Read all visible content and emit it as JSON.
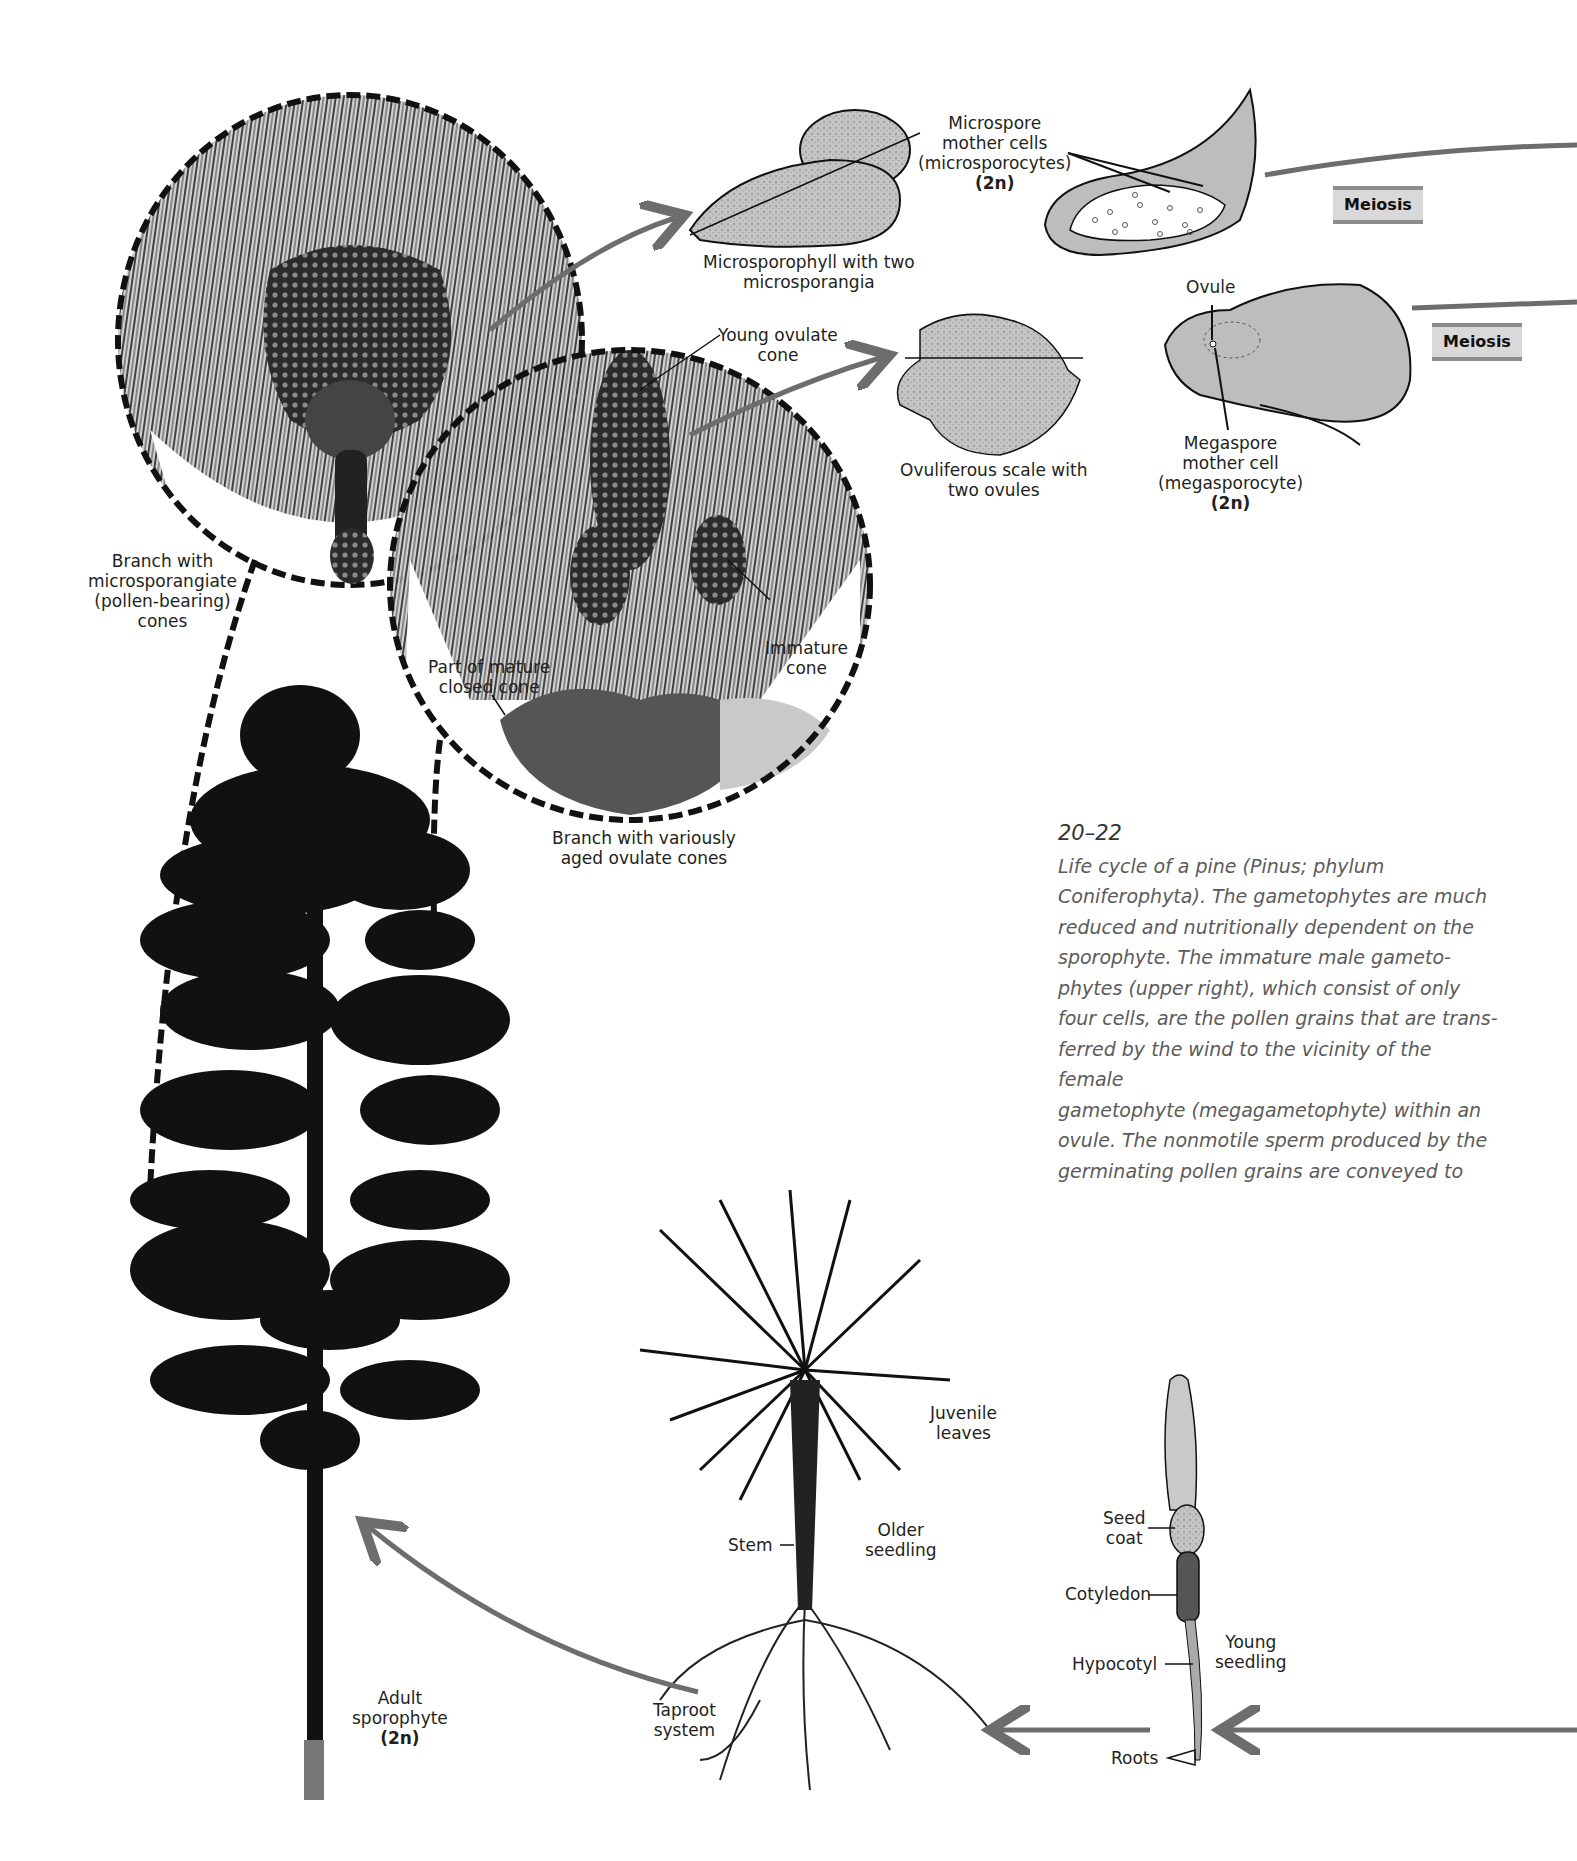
{
  "figure": {
    "number": "20–22",
    "caption_parts": [
      {
        "text": "Life cycle of a pine ",
        "style": "italic"
      },
      {
        "text": "(Pinus; ",
        "style": "upright"
      },
      {
        "text": "phylum ",
        "style": "italic"
      },
      {
        "text": "Coniferophyta).",
        "style": "upright"
      },
      {
        "text": " The gametophytes are much reduced and nutritionally dependent on the sporophyte. The immature male gameto-phytes (upper right), which consist of only four cells, are the pollen grains that are trans-ferred by the wind to the vicinity of the female gametophyte (megagametophyte) within an ovule. The nonmotile sperm produced by the germinating pollen grains are conveyed to",
        "style": "italic"
      }
    ],
    "caption_lines": [
      "Life cycle of a pine (Pinus; phylum",
      "Coniferophyta). The gametophytes are much",
      "reduced and nutritionally dependent on the",
      "sporophyte. The immature male gameto-",
      "phytes (upper right), which consist of only",
      "four cells, are the pollen grains that are trans-",
      "ferred by the wind to the vicinity of the female",
      "gametophyte (megagametophyte) within an",
      "ovule. The nonmotile sperm produced by the",
      "germinating pollen grains are conveyed to"
    ]
  },
  "labels": {
    "microspore_mother_cells": [
      "Microspore",
      "mother cells",
      "(microsporocytes)",
      "(2n)"
    ],
    "microsporophyll": [
      "Microsporophyll with two",
      "microsporangia"
    ],
    "young_ovulate_cone": [
      "Young ovulate",
      "cone"
    ],
    "ovuliferous_scale": [
      "Ovuliferous scale with",
      "two ovules"
    ],
    "ovule": "Ovule",
    "megaspore_mother_cell": [
      "Megaspore",
      "mother cell",
      "(megasporocyte)",
      "(2n)"
    ],
    "branch_microsporangiate": [
      "Branch with",
      "microsporangiate",
      "(pollen-bearing)",
      "cones"
    ],
    "immature_cone": [
      "Immature",
      "cone"
    ],
    "mature_closed_cone": [
      "Part of mature",
      "closed cone"
    ],
    "branch_ovulate": [
      "Branch with variously",
      "aged ovulate cones"
    ],
    "juvenile_leaves": [
      "Juvenile",
      "leaves"
    ],
    "stem": "Stem",
    "older_seedling": [
      "Older",
      "seedling"
    ],
    "taproot_system": [
      "Taproot",
      "system"
    ],
    "adult_sporophyte": [
      "Adult",
      "sporophyte",
      "(2n)"
    ],
    "seed_coat": [
      "Seed",
      "coat"
    ],
    "cotyledon": "Cotyledon",
    "hypocotyl": "Hypocotyl",
    "young_seedling": [
      "Young",
      "seedling"
    ],
    "roots": "Roots"
  },
  "process_boxes": {
    "meiosis_top": "Meiosis",
    "meiosis_bottom": "Meiosis"
  },
  "colors": {
    "arrow": "#6d6d6d",
    "meiosis_fill": "#d9d9d9",
    "meiosis_border": "#8c8c8c",
    "structure_fill": "#bdbdbd",
    "ink": "#111111",
    "caption_text": "#5b5b5b"
  }
}
